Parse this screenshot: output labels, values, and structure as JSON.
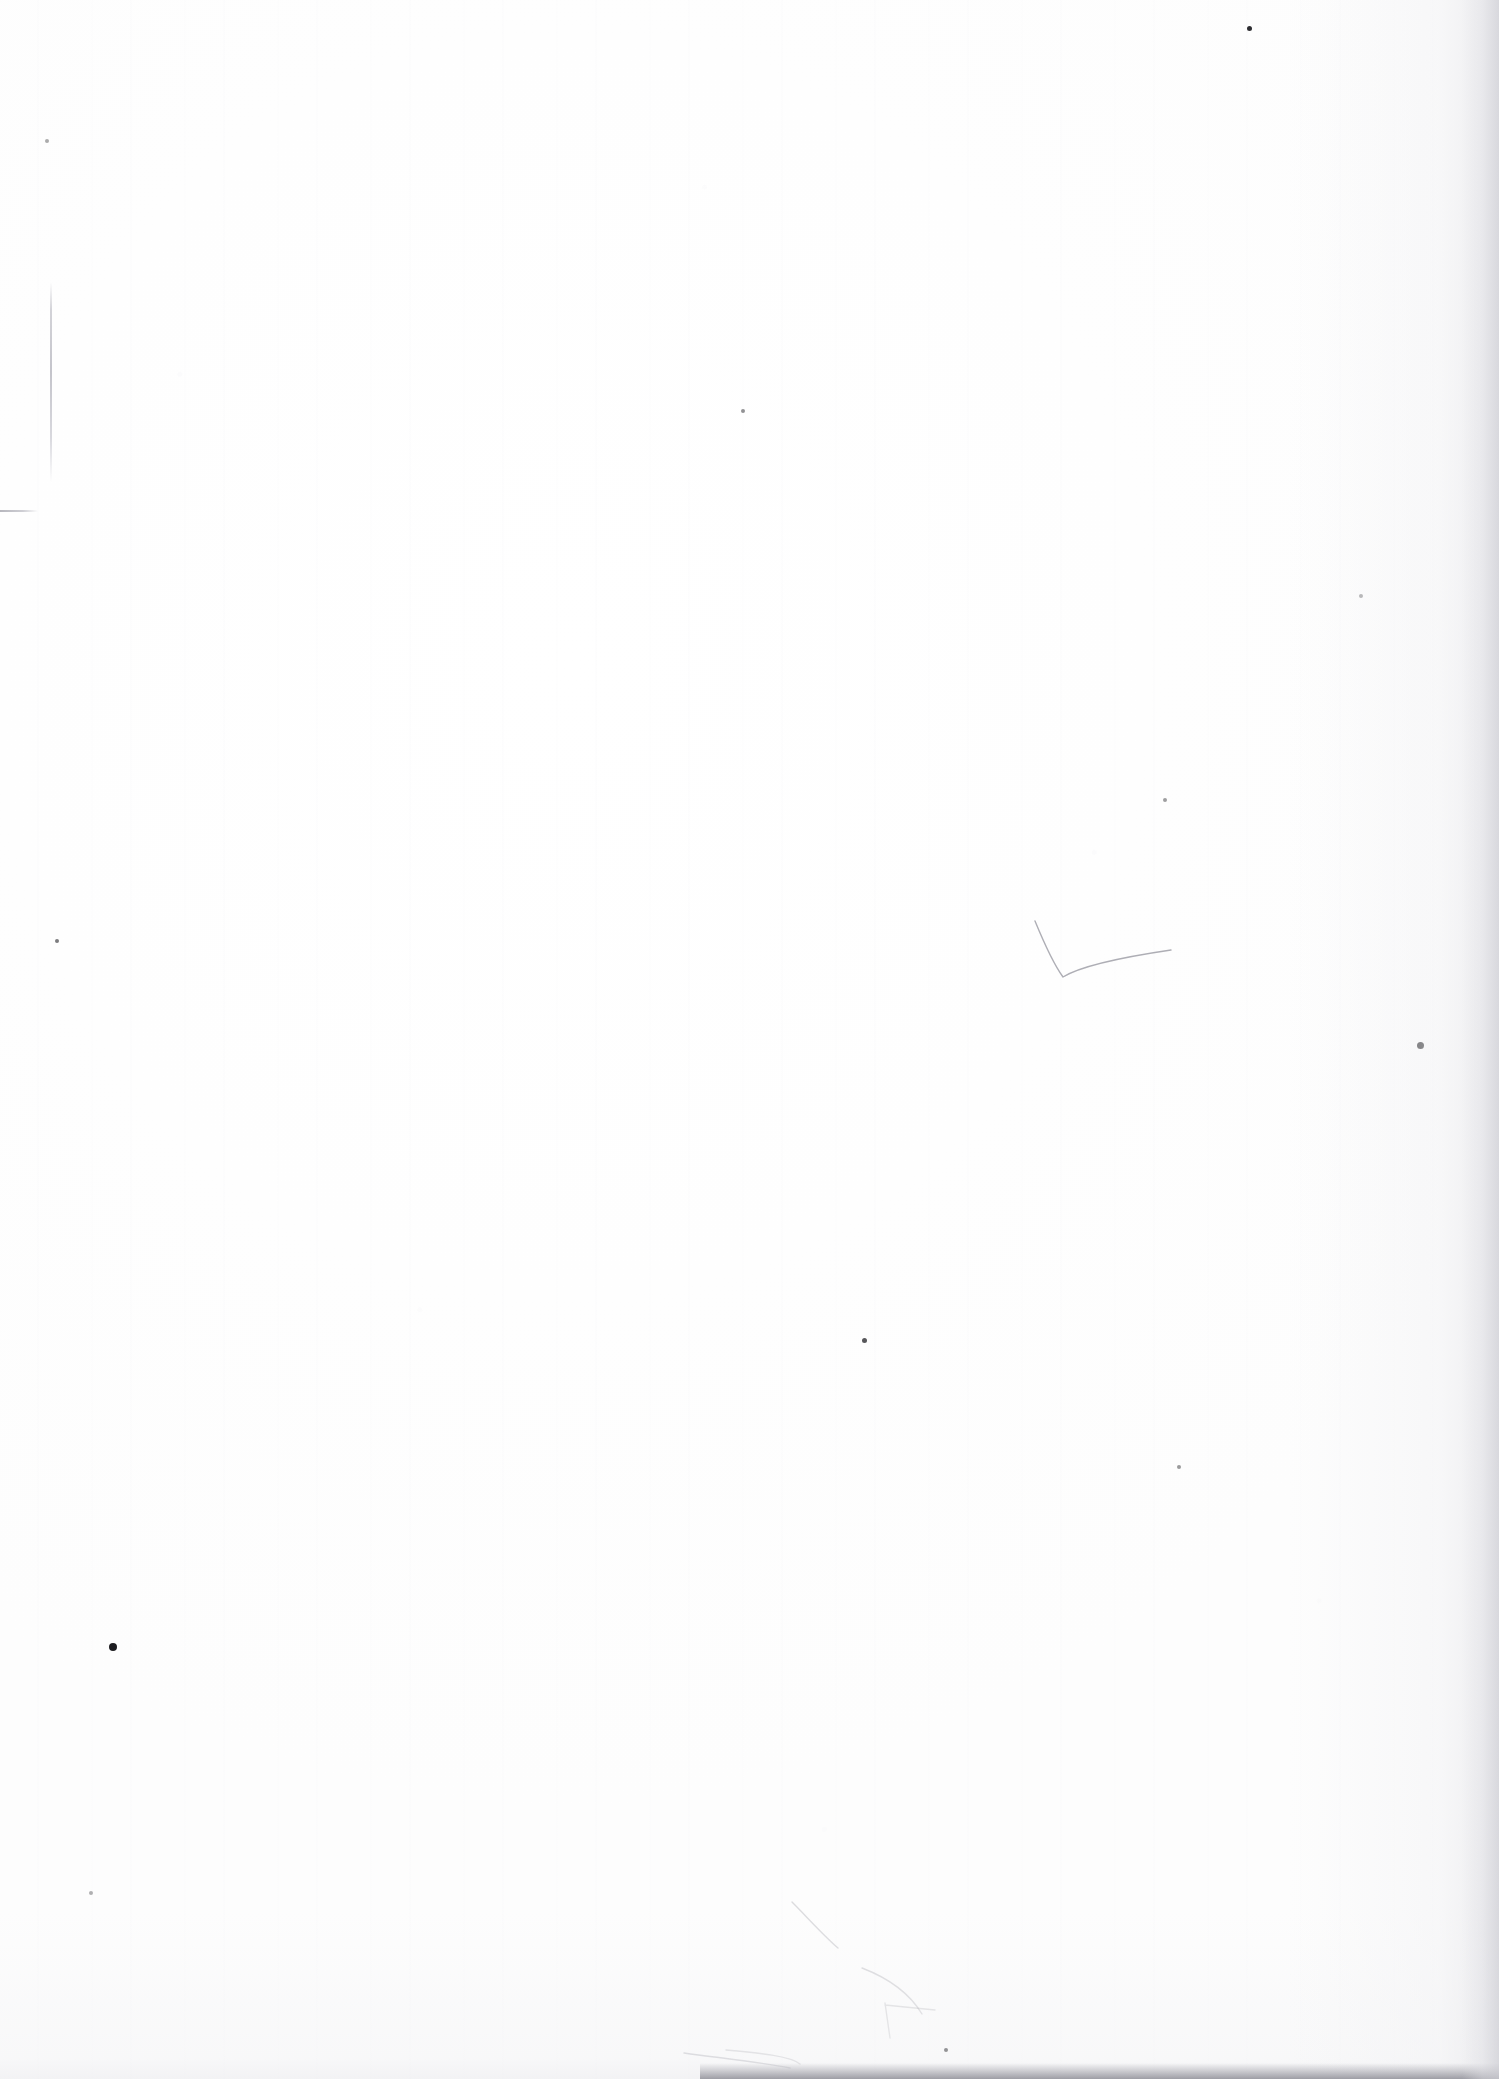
{
  "document": {
    "kind": "scanned-page",
    "content_description": "Blank page — no printed or handwritten text content",
    "page_label": "",
    "background_color": "#ffffff",
    "paper_tone": "#fdfdfd",
    "artifact_ink_color": "#9a9aa2",
    "edge_shadow_color": "#94949c",
    "speck_color": "#101014",
    "width_px": 1499,
    "height_px": 2079
  },
  "artifacts": {
    "label": "scan artifacts",
    "specks": [
      {
        "name": "speck-top-right",
        "x": 1249,
        "y": 28,
        "size": 5,
        "opacity": 0.88
      },
      {
        "name": "speck-right-upper",
        "x": 1420,
        "y": 1045,
        "size": 7,
        "opacity": 0.92
      },
      {
        "name": "speck-left-lower",
        "x": 113,
        "y": 1647,
        "size": 8,
        "opacity": 0.95
      },
      {
        "name": "speck-center-lower",
        "x": 864,
        "y": 1340,
        "size": 5,
        "opacity": 0.7
      },
      {
        "name": "speck-bottom-center",
        "x": 946,
        "y": 2050,
        "size": 4,
        "opacity": 0.75
      },
      {
        "name": "speck-mid-left",
        "x": 57,
        "y": 941,
        "size": 4,
        "opacity": 0.55
      },
      {
        "name": "speck-upper-mid",
        "x": 743,
        "y": 411,
        "size": 4,
        "opacity": 0.45
      },
      {
        "name": "speck-upper-right",
        "x": 1165,
        "y": 800,
        "size": 4,
        "opacity": 0.4
      },
      {
        "name": "speck-right-mid",
        "x": 1361,
        "y": 596,
        "size": 4,
        "opacity": 0.38
      },
      {
        "name": "speck-left-upper",
        "x": 47,
        "y": 141,
        "size": 4,
        "opacity": 0.35
      },
      {
        "name": "speck-lower-right",
        "x": 1179,
        "y": 1467,
        "size": 4,
        "opacity": 0.42
      },
      {
        "name": "speck-bottom-left",
        "x": 91,
        "y": 1893,
        "size": 4,
        "opacity": 0.32
      }
    ],
    "creases": [
      {
        "name": "crease-left-margin",
        "x": 50,
        "y": 282,
        "height": 200
      }
    ],
    "rules": [
      {
        "name": "rule-left-edge",
        "x": 0,
        "y": 510,
        "width": 38
      }
    ],
    "pencil_strokes": [
      {
        "name": "stroke-check-mark",
        "path": "M 1035 921 C 1042 938, 1052 962, 1063 977 C 1076 969, 1110 959, 1171 950",
        "opacity": 0.72
      },
      {
        "name": "stroke-fold-upper",
        "path": "M 792 1902 C 808 1918, 822 1934, 838 1948",
        "opacity": 0.3
      },
      {
        "name": "stroke-fold-arc",
        "path": "M 862 1968 C 888 1978, 910 1994, 922 2014",
        "opacity": 0.32
      },
      {
        "name": "stroke-fold-cross",
        "path": "M 885 2003 L 890 2038 M 885 2005 L 935 2010",
        "opacity": 0.28
      },
      {
        "name": "stroke-bottom-fold",
        "path": "M 684 2053 C 720 2058, 760 2062, 790 2068",
        "opacity": 0.45
      },
      {
        "name": "stroke-bottom-lip",
        "path": "M 726 2050 C 760 2053, 790 2056, 800 2064",
        "opacity": 0.35
      }
    ],
    "edge_shadows": [
      {
        "name": "shadow-bottom",
        "x": 700,
        "y": 2063,
        "width": 799,
        "height": 16
      },
      {
        "name": "shadow-right",
        "x": 1462,
        "y": 0,
        "width": 37,
        "height": 2079
      }
    ]
  }
}
